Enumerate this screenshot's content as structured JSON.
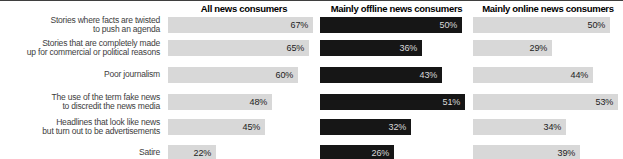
{
  "chart_data": {
    "type": "bar",
    "title": "",
    "orientation": "horizontal",
    "panels": 3,
    "value_suffix": "%",
    "value_labels_position": "inside-right",
    "normalization": "per-series-max",
    "categories": [
      [
        "Stories where facts are twisted",
        "to push an agenda"
      ],
      [
        "Stories that are completely made",
        "up for commercial or political reasons"
      ],
      [
        "Poor journalism"
      ],
      [
        "The use of the term fake news",
        "to discredit the news media"
      ],
      [
        "Headlines that look like news",
        "but turn out to be advertisements"
      ],
      [
        "Satire"
      ]
    ],
    "series": [
      {
        "name": "All news consumers",
        "variant": "light",
        "values": [
          67,
          65,
          60,
          48,
          45,
          22
        ]
      },
      {
        "name": "Mainly offline news consumers",
        "variant": "dark",
        "values": [
          50,
          36,
          43,
          51,
          32,
          26
        ]
      },
      {
        "name": "Mainly online news consumers",
        "variant": "light",
        "values": [
          50,
          29,
          44,
          53,
          34,
          39
        ]
      }
    ],
    "colors": {
      "light_bar": "#d8d8d8",
      "dark_bar": "#161616",
      "light_bar_text": "#222222",
      "dark_bar_text": "#d9d9d9",
      "category_text": "#3d3d3d",
      "header_text": "#000000",
      "top_rule": "#3f3f3f"
    }
  }
}
